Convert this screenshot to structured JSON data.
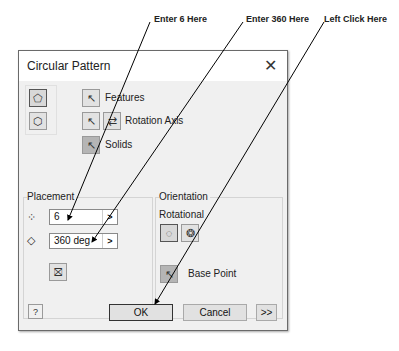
{
  "callouts": {
    "enter6": "Enter 6 Here",
    "enter360": "Enter 360 Here",
    "leftclick": "Left Click Here"
  },
  "dialog": {
    "title": "Circular Pattern",
    "close_glyph": "✕",
    "selection": {
      "features_label": "Features",
      "rotation_axis_label": "Rotation Axis",
      "solids_label": "Solids"
    },
    "placement": {
      "title": "Placement",
      "count_value": "6",
      "angle_value": "360 deg",
      "arrow_glyph": ">"
    },
    "orientation": {
      "title": "Orientation",
      "rotational_label": "Rotational",
      "base_point_label": "Base Point"
    },
    "footer": {
      "help_glyph": "?",
      "ok_label": "OK",
      "cancel_label": "Cancel",
      "more_label": ">>"
    }
  }
}
